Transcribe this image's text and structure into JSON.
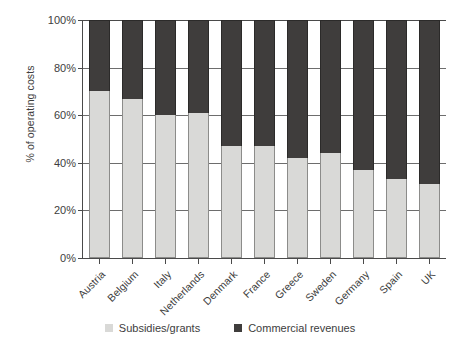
{
  "chart_data": {
    "type": "bar",
    "title": "",
    "subtitle": "",
    "xlabel": "",
    "ylabel": "% of operating costs",
    "ylim": [
      0,
      100
    ],
    "ytick_labels": [
      "100%",
      "80%",
      "60%",
      "40%",
      "20%",
      "0%"
    ],
    "ytick_values": [
      100,
      80,
      60,
      40,
      20,
      0
    ],
    "grid": true,
    "stacked": true,
    "stack_total": 100,
    "legend_position": "bottom",
    "categories": [
      "Austria",
      "Belgium",
      "Italy",
      "Netherlands",
      "Denmark",
      "France",
      "Greece",
      "Sweden",
      "Germany",
      "Spain",
      "UK"
    ],
    "series": [
      {
        "name": "Subsidies/grants",
        "color": "#d9d9d7",
        "values": [
          70,
          67,
          60,
          61,
          47,
          47,
          42,
          44,
          37,
          33,
          31
        ]
      },
      {
        "name": "Commercial revenues",
        "color": "#3f3d3c",
        "values": [
          30,
          33,
          40,
          39,
          53,
          53,
          58,
          56,
          63,
          67,
          69
        ]
      }
    ]
  },
  "axes": {
    "y_title": "% of operating costs",
    "y_ticks": [
      {
        "label": "100%",
        "value": 100
      },
      {
        "label": "80%",
        "value": 80
      },
      {
        "label": "60%",
        "value": 60
      },
      {
        "label": "40%",
        "value": 40
      },
      {
        "label": "20%",
        "value": 20
      },
      {
        "label": "0%",
        "value": 0
      }
    ]
  },
  "legend": {
    "items": [
      {
        "label": "Subsidies/grants",
        "color": "#d9d9d7"
      },
      {
        "label": "Commercial revenues",
        "color": "#3f3d3c"
      }
    ]
  }
}
